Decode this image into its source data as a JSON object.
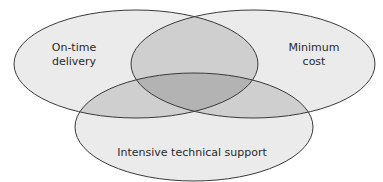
{
  "diagram": {
    "type": "venn",
    "sets": [
      {
        "id": "A",
        "label_lines": [
          "On-time",
          "delivery"
        ],
        "cx": 136,
        "cy": 64,
        "rx": 122,
        "ry": 54
      },
      {
        "id": "B",
        "label_lines": [
          "Minimum",
          "cost"
        ],
        "cx": 253,
        "cy": 64,
        "rx": 122,
        "ry": 54
      },
      {
        "id": "C",
        "label_lines": [
          "Intensive technical support"
        ],
        "cx": 194,
        "cy": 127,
        "rx": 119,
        "ry": 54
      }
    ],
    "colors": {
      "background": "#ffffff",
      "single_region": "#ebebeb",
      "double_region": "#cfcfcf",
      "triple_region": "#b3b3b3",
      "stroke": "#3a3a3a",
      "text": "#2a2a2a"
    }
  }
}
